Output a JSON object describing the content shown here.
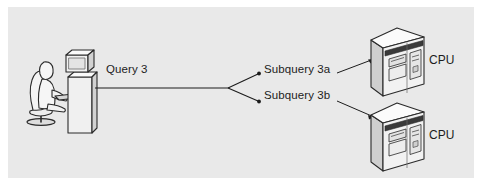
{
  "figure": {
    "panel_background": "#e9e9e9",
    "page_background": "#ffffff",
    "stroke_color": "#1c1c1c",
    "text_color": "#1c1c1c"
  },
  "labels": {
    "query": "Query 3",
    "subquery_a": "Subquery 3a",
    "subquery_b": "Subquery 3b",
    "cpu_top": "CPU",
    "cpu_bottom": "CPU"
  },
  "nodes": {
    "client": {
      "name": "user-at-workstation",
      "description": "Seated person using a desktop computer"
    },
    "server_top": {
      "name": "cpu-tower-top",
      "label": "CPU"
    },
    "server_bottom": {
      "name": "cpu-tower-bottom",
      "label": "CPU"
    }
  },
  "edges": [
    {
      "from": "client",
      "to": "branch",
      "label": "Query 3"
    },
    {
      "from": "branch",
      "to": "subquery_a_label",
      "label": "Subquery 3a"
    },
    {
      "from": "branch",
      "to": "subquery_b_label",
      "label": "Subquery 3b"
    },
    {
      "from": "subquery_a_label",
      "to": "cpu-tower-top",
      "label": ""
    },
    {
      "from": "subquery_b_label",
      "to": "cpu-tower-bottom",
      "label": ""
    }
  ],
  "colors": {
    "tower_front": "#f2f2f2",
    "tower_side": "#cfcfcf",
    "tower_top": "#fbfbfb",
    "tower_band": "#3a3a3a",
    "person_fill": "#f6f6f6",
    "monitor_fill": "#f2f2f2",
    "line": "#1c1c1c"
  }
}
